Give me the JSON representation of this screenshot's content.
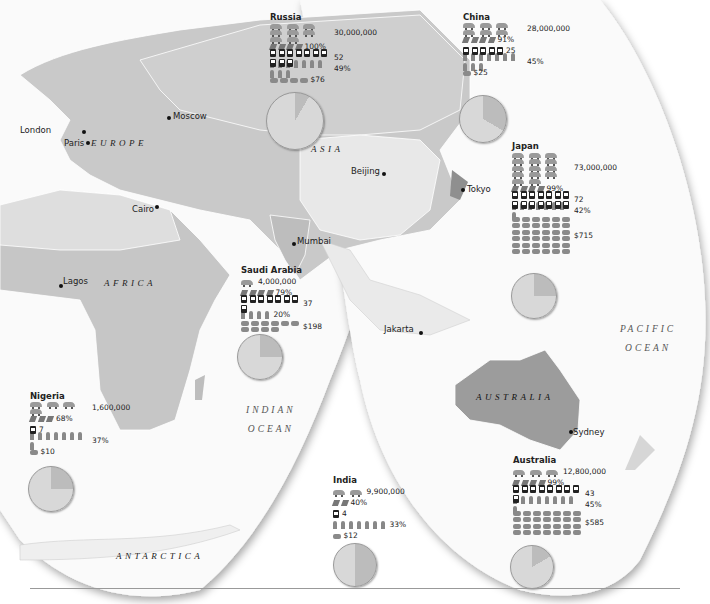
{
  "colors": {
    "land_light": "#e6e6e6",
    "land_mid": "#c4c4c4",
    "land_dark": "#a6a6a6",
    "ocean": "#ffffff",
    "pie_main": "#d8d8d8",
    "pie_slice": "#bcbcbc"
  },
  "cities": [
    {
      "name": "London",
      "x": 20,
      "y": 130,
      "dx": 82,
      "dy": 131
    },
    {
      "name": "Paris",
      "x": 64,
      "y": 142,
      "dx": 87,
      "dy": 142
    },
    {
      "name": "Moscow",
      "x": 172,
      "y": 112,
      "dx": 168,
      "dy": 118
    },
    {
      "name": "Cairo",
      "x": 133,
      "y": 207,
      "dx": 156,
      "dy": 206
    },
    {
      "name": "Lagos",
      "x": 62,
      "y": 279,
      "dx": 60,
      "dy": 285
    },
    {
      "name": "Beijing",
      "x": 351,
      "y": 170,
      "dx": 382,
      "dy": 173
    },
    {
      "name": "Tokyo",
      "x": 466,
      "y": 188,
      "dx": 462,
      "dy": 189
    },
    {
      "name": "Mumbai",
      "x": 297,
      "y": 240,
      "dx": 292,
      "dy": 243
    },
    {
      "name": "Jakarta",
      "x": 384,
      "y": 326,
      "dx": 419,
      "dy": 332
    },
    {
      "name": "Sydney",
      "x": 572,
      "y": 430,
      "dx": 570,
      "dy": 431
    }
  ],
  "regions": [
    {
      "name": "EUROPE",
      "x": 91,
      "y": 141
    },
    {
      "name": "ASIA",
      "x": 311,
      "y": 147
    },
    {
      "name": "AFRICA",
      "x": 104,
      "y": 281
    },
    {
      "name": "AUSTRALIA",
      "x": 476,
      "y": 395
    },
    {
      "name": "ANTARCTICA",
      "x": 116,
      "y": 553
    }
  ],
  "oceans": [
    {
      "line1": "INDIAN",
      "line2": "OCEAN",
      "x": 246,
      "y": 407
    },
    {
      "line1": "PACIFIC",
      "line2": "OCEAN",
      "x": 620,
      "y": 327
    }
  ],
  "countries": [
    {
      "name": "Russia",
      "x": 270,
      "y": 13,
      "cars_icons": 8,
      "cars": "30,000,000",
      "bars": 4,
      "pct1": "100%",
      "phones": 10,
      "phones_val": "52",
      "people": 10,
      "pct2": "49%",
      "coins": 4,
      "money": "$76",
      "pie": {
        "x": 266,
        "y": 92,
        "size": 56,
        "slice_deg": 30
      }
    },
    {
      "name": "China",
      "x": 463,
      "y": 13,
      "cars_icons": 6,
      "cars": "28,000,000",
      "bars": 4,
      "pct1": "91%",
      "phones": 5,
      "phones_val": "25",
      "people": 10,
      "pct2": "45%",
      "coins": 1,
      "money": "$25",
      "pie": {
        "x": 459,
        "y": 95,
        "size": 46,
        "slice_deg": 120
      }
    },
    {
      "name": "Japan",
      "x": 512,
      "y": 142,
      "cars_icons": 14,
      "cars": "73,000,000",
      "bars": 4,
      "pct1": "99%",
      "phones": 14,
      "phones_val": "72",
      "people": 8,
      "pct2": "42%",
      "coins": 36,
      "money": "$715",
      "pie": {
        "x": 511,
        "y": 273,
        "size": 44,
        "slice_deg": 90
      }
    },
    {
      "name": "Saudi Arabia",
      "x": 241,
      "y": 266,
      "cars_icons": 1,
      "cars": "4,000,000",
      "bars": 4,
      "pct1": "79%",
      "phones": 8,
      "phones_val": "37",
      "people": 4,
      "pct2": "20%",
      "coins": 10,
      "money": "$198",
      "pie": {
        "x": 237,
        "y": 334,
        "size": 44,
        "slice_deg": 90
      }
    },
    {
      "name": "Nigeria",
      "x": 30,
      "y": 392,
      "cars_icons": 4,
      "cars": "1,600,000",
      "bars": 3,
      "pct1": "68%",
      "phones": 1,
      "phones_val": "7",
      "people": 8,
      "pct2": "37%",
      "coins": 1,
      "money": "$10",
      "pie": {
        "x": 28,
        "y": 466,
        "size": 44,
        "slice_deg": 90
      }
    },
    {
      "name": "India",
      "x": 333,
      "y": 476,
      "cars_icons": 2,
      "cars": "9,900,000",
      "bars": 2,
      "pct1": "40%",
      "phones": 1,
      "phones_val": "4",
      "people": 7,
      "pct2": "33%",
      "coins": 1,
      "money": "$12",
      "pie": {
        "x": 333,
        "y": 543,
        "size": 42,
        "slice_deg": 180
      }
    },
    {
      "name": "Australia",
      "x": 513,
      "y": 456,
      "cars_icons": 3,
      "cars": "12,800,000",
      "bars": 4,
      "pct1": "99%",
      "phones": 9,
      "phones_val": "43",
      "people": 9,
      "pct2": "45%",
      "coins": 28,
      "money": "$585",
      "pie": {
        "x": 510,
        "y": 545,
        "size": 42,
        "slice_deg": 60
      }
    }
  ],
  "chart_data": {
    "type": "table",
    "columns": [
      "Country",
      "Cars",
      "Bar %",
      "Phones (per 100)",
      "People %",
      "Money"
    ],
    "rows": [
      [
        "Russia",
        30000000,
        100,
        52,
        49,
        76
      ],
      [
        "China",
        28000000,
        91,
        25,
        45,
        25
      ],
      [
        "Japan",
        73000000,
        99,
        72,
        42,
        715
      ],
      [
        "Saudi Arabia",
        4000000,
        79,
        37,
        20,
        198
      ],
      [
        "Nigeria",
        1600000,
        68,
        7,
        37,
        10
      ],
      [
        "India",
        9900000,
        40,
        4,
        33,
        12
      ],
      [
        "Australia",
        12800000,
        99,
        43,
        45,
        585
      ]
    ]
  }
}
